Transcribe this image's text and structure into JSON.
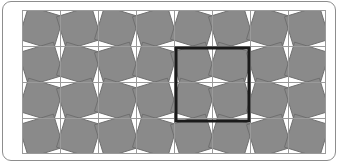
{
  "figure": {
    "background_color": "#ffffff",
    "frame": {
      "border_color": "#8d8d8d",
      "border_radius_px": 9,
      "x": 2,
      "y": 1,
      "width": 334,
      "height": 160
    }
  },
  "pattern": {
    "type": "tiling",
    "description": "Grid of square cells, each containing a gray square rotated about its centre; rotation direction alternates in a checkerboard fashion producing the rotating-squares illusion.",
    "origin_x": 22,
    "origin_y": 10,
    "width": 304,
    "height": 144,
    "columns": 8,
    "rows": 4,
    "cell_width": 38,
    "cell_height": 36,
    "tile_fill_color": "#8a8a8a",
    "tile_stroke_color": "#6f6f6f",
    "background_color": "#ffffff",
    "grid_line_color": "#9a9a9a",
    "grid_line_width": 1,
    "rotation_degrees": 17,
    "inner_square_scale": 0.96
  },
  "highlight": {
    "name": "emphasis-square",
    "shape": "square",
    "stroke_color": "#1a1a1a",
    "stroke_width": 3,
    "fill": "none",
    "x": 176,
    "y": 48,
    "width": 73,
    "height": 73,
    "spans_columns": 2,
    "spans_rows": 2,
    "note": "Outlines a 2x2 block of cells centred on a grid intersection."
  }
}
